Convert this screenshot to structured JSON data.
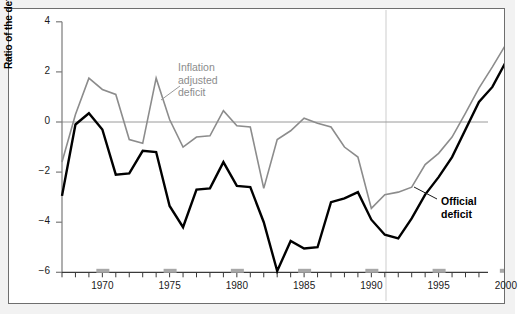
{
  "figure": {
    "background_color": "#f2f2f2",
    "plot_background_color": "#ffffff",
    "frame_color": "#6e6e6e"
  },
  "axes": {
    "ylabel": "Ratio of the deficit to GDP (percent)",
    "xlabel": "",
    "y_ticks": [
      "4",
      "2",
      "0",
      "−2",
      "−4",
      "−6"
    ],
    "x_ticks": [
      "1970",
      "1975",
      "1980",
      "1985",
      "1990",
      "1995",
      "2000"
    ]
  },
  "annotations": [
    {
      "name": "inflation-adjusted-deficit-label",
      "text": "Inflation\nadjusted\ndeficit",
      "color": "#8c8c8c"
    },
    {
      "name": "official-deficit-label",
      "text": "Official\ndeficit",
      "color": "#000000"
    }
  ],
  "chart_data": {
    "type": "line",
    "title": "",
    "xlabel": "",
    "ylabel": "Ratio of the deficit to GDP (percent)",
    "xlim": [
      1967,
      2002
    ],
    "ylim": [
      -6,
      4
    ],
    "grid": false,
    "zero_line": true,
    "legend_position": "inline-annotations",
    "x": [
      1967,
      1968,
      1969,
      1970,
      1971,
      1972,
      1973,
      1974,
      1975,
      1976,
      1977,
      1978,
      1979,
      1980,
      1981,
      1982,
      1983,
      1984,
      1985,
      1986,
      1987,
      1988,
      1989,
      1990,
      1991,
      1992,
      1993,
      1994,
      1995,
      1996,
      1997,
      1998,
      1999,
      2000,
      2001
    ],
    "series": [
      {
        "name": "Inflation adjusted deficit",
        "color": "#8c8c8c",
        "values": [
          -1.6,
          0.3,
          1.75,
          1.3,
          1.1,
          -0.7,
          -0.85,
          1.75,
          0.1,
          -1.0,
          -0.6,
          -0.55,
          0.45,
          -0.15,
          -0.2,
          -2.65,
          -0.7,
          -0.35,
          0.15,
          -0.05,
          -0.2,
          -1.0,
          -1.4,
          -3.45,
          -2.9,
          -2.8,
          -2.6,
          -1.7,
          -1.25,
          -0.6,
          0.35,
          1.35,
          2.2,
          3.1,
          2.6
        ]
      },
      {
        "name": "Official deficit",
        "color": "#000000",
        "values": [
          -2.95,
          -0.1,
          0.35,
          -0.3,
          -2.1,
          -2.05,
          -1.15,
          -1.2,
          -3.35,
          -4.2,
          -2.7,
          -2.65,
          -1.6,
          -2.55,
          -2.6,
          -4.0,
          -5.95,
          -4.75,
          -5.05,
          -5.0,
          -3.2,
          -3.05,
          -2.8,
          -3.9,
          -4.5,
          -4.65,
          -3.85,
          -2.9,
          -2.2,
          -1.4,
          -0.3,
          0.8,
          1.4,
          2.4,
          1.6
        ]
      }
    ]
  }
}
